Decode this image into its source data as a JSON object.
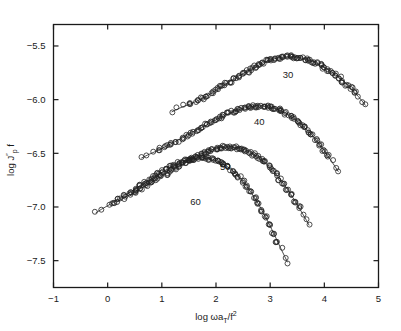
{
  "chart_data": {
    "type": "scatter",
    "title": "",
    "subtitle": "",
    "xlabel": "log ωa_T/f²",
    "xlabel_parts": {
      "main": "log ωa",
      "sub": "T",
      "mid": "/f",
      "sup": "2"
    },
    "ylabel": "log J″_p f",
    "ylabel_parts": {
      "main": "log J",
      "sup": "″",
      "sub": "p",
      "tail": "f"
    },
    "xlim": [
      -1,
      5
    ],
    "ylim": [
      -7.75,
      -5.3
    ],
    "xticks": [
      -1,
      0,
      1,
      2,
      3,
      4,
      5
    ],
    "xtick_labels": [
      "−1",
      "0",
      "1",
      "2",
      "3",
      "4",
      "5"
    ],
    "yticks": [
      -5.5,
      -6.0,
      -6.5,
      -7.0,
      -7.5
    ],
    "ytick_labels": [
      "−5.5",
      "−6.0",
      "−6.5",
      "−7.0",
      "−7.5"
    ],
    "grid": false,
    "legend_position": "inline-curve-labels",
    "marker": "open-circle",
    "marker_color": "#222222",
    "line_color": "#222222",
    "series": [
      {
        "name": "30",
        "label": "30",
        "label_x": 3.33,
        "label_y": -5.8,
        "points": [
          [
            1.18,
            -6.115
          ],
          [
            1.3,
            -6.085
          ],
          [
            1.42,
            -6.06
          ],
          [
            1.53,
            -6.04
          ],
          [
            1.64,
            -6.015
          ],
          [
            1.74,
            -5.99
          ],
          [
            1.84,
            -5.965
          ],
          [
            1.93,
            -5.935
          ],
          [
            2.02,
            -5.905
          ],
          [
            2.1,
            -5.88
          ],
          [
            2.18,
            -5.855
          ],
          [
            2.26,
            -5.83
          ],
          [
            2.34,
            -5.805
          ],
          [
            2.42,
            -5.78
          ],
          [
            2.5,
            -5.758
          ],
          [
            2.58,
            -5.735
          ],
          [
            2.66,
            -5.712
          ],
          [
            2.74,
            -5.692
          ],
          [
            2.81,
            -5.672
          ],
          [
            2.88,
            -5.655
          ],
          [
            2.95,
            -5.64
          ],
          [
            3.02,
            -5.628
          ],
          [
            3.09,
            -5.618
          ],
          [
            3.16,
            -5.61
          ],
          [
            3.23,
            -5.604
          ],
          [
            3.3,
            -5.6
          ],
          [
            3.37,
            -5.6
          ],
          [
            3.44,
            -5.602
          ],
          [
            3.51,
            -5.606
          ],
          [
            3.58,
            -5.612
          ],
          [
            3.65,
            -5.62
          ],
          [
            3.72,
            -5.632
          ],
          [
            3.79,
            -5.646
          ],
          [
            3.86,
            -5.662
          ],
          [
            3.93,
            -5.68
          ],
          [
            4.0,
            -5.7
          ],
          [
            4.07,
            -5.722
          ],
          [
            4.14,
            -5.745
          ],
          [
            4.21,
            -5.77
          ],
          [
            4.28,
            -5.798
          ],
          [
            4.35,
            -5.828
          ],
          [
            4.42,
            -5.86
          ],
          [
            4.49,
            -5.895
          ],
          [
            4.56,
            -5.932
          ],
          [
            4.63,
            -5.972
          ],
          [
            4.7,
            -6.014
          ],
          [
            4.76,
            -6.055
          ]
        ]
      },
      {
        "name": "40",
        "label": "40",
        "label_x": 2.8,
        "label_y": -6.24,
        "points": [
          [
            0.62,
            -6.545
          ],
          [
            0.74,
            -6.515
          ],
          [
            0.86,
            -6.488
          ],
          [
            0.97,
            -6.462
          ],
          [
            1.08,
            -6.435
          ],
          [
            1.18,
            -6.408
          ],
          [
            1.28,
            -6.382
          ],
          [
            1.38,
            -6.356
          ],
          [
            1.47,
            -6.33
          ],
          [
            1.56,
            -6.305
          ],
          [
            1.65,
            -6.282
          ],
          [
            1.74,
            -6.258
          ],
          [
            1.83,
            -6.235
          ],
          [
            1.91,
            -6.212
          ],
          [
            1.99,
            -6.19
          ],
          [
            2.07,
            -6.17
          ],
          [
            2.15,
            -6.15
          ],
          [
            2.23,
            -6.132
          ],
          [
            2.31,
            -6.115
          ],
          [
            2.38,
            -6.1
          ],
          [
            2.45,
            -6.088
          ],
          [
            2.52,
            -6.078
          ],
          [
            2.59,
            -6.07
          ],
          [
            2.66,
            -6.064
          ],
          [
            2.73,
            -6.06
          ],
          [
            2.8,
            -6.058
          ],
          [
            2.87,
            -6.06
          ],
          [
            2.94,
            -6.065
          ],
          [
            3.01,
            -6.072
          ],
          [
            3.08,
            -6.082
          ],
          [
            3.15,
            -6.095
          ],
          [
            3.22,
            -6.11
          ],
          [
            3.29,
            -6.128
          ],
          [
            3.36,
            -6.15
          ],
          [
            3.43,
            -6.174
          ],
          [
            3.5,
            -6.2
          ],
          [
            3.57,
            -6.23
          ],
          [
            3.64,
            -6.262
          ],
          [
            3.71,
            -6.298
          ],
          [
            3.78,
            -6.336
          ],
          [
            3.85,
            -6.378
          ],
          [
            3.92,
            -6.422
          ],
          [
            3.99,
            -6.47
          ],
          [
            4.06,
            -6.52
          ],
          [
            4.13,
            -6.572
          ],
          [
            4.2,
            -6.625
          ],
          [
            4.26,
            -6.672
          ]
        ]
      },
      {
        "name": "50",
        "label": "50",
        "label_x": 2.17,
        "label_y": -6.66,
        "points": [
          [
            0.18,
            -6.95
          ],
          [
            0.29,
            -6.918
          ],
          [
            0.4,
            -6.888
          ],
          [
            0.51,
            -6.858
          ],
          [
            0.61,
            -6.828
          ],
          [
            0.71,
            -6.8
          ],
          [
            0.81,
            -6.772
          ],
          [
            0.9,
            -6.744
          ],
          [
            0.99,
            -6.716
          ],
          [
            1.08,
            -6.69
          ],
          [
            1.17,
            -6.664
          ],
          [
            1.25,
            -6.64
          ],
          [
            1.33,
            -6.616
          ],
          [
            1.41,
            -6.592
          ],
          [
            1.49,
            -6.57
          ],
          [
            1.57,
            -6.548
          ],
          [
            1.64,
            -6.528
          ],
          [
            1.71,
            -6.51
          ],
          [
            1.78,
            -6.494
          ],
          [
            1.85,
            -6.48
          ],
          [
            1.92,
            -6.468
          ],
          [
            1.99,
            -6.458
          ],
          [
            2.06,
            -6.45
          ],
          [
            2.13,
            -6.444
          ],
          [
            2.2,
            -6.441
          ],
          [
            2.27,
            -6.441
          ],
          [
            2.34,
            -6.444
          ],
          [
            2.41,
            -6.45
          ],
          [
            2.48,
            -6.46
          ],
          [
            2.55,
            -6.472
          ],
          [
            2.62,
            -6.488
          ],
          [
            2.69,
            -6.508
          ],
          [
            2.76,
            -6.53
          ],
          [
            2.83,
            -6.556
          ],
          [
            2.9,
            -6.585
          ],
          [
            2.97,
            -6.618
          ],
          [
            3.04,
            -6.654
          ],
          [
            3.11,
            -6.694
          ],
          [
            3.18,
            -6.738
          ],
          [
            3.25,
            -6.786
          ],
          [
            3.32,
            -6.836
          ],
          [
            3.39,
            -6.89
          ],
          [
            3.46,
            -6.946
          ],
          [
            3.53,
            -7.004
          ],
          [
            3.6,
            -7.064
          ],
          [
            3.67,
            -7.124
          ],
          [
            3.72,
            -7.172
          ]
        ]
      },
      {
        "name": "60",
        "label": "60",
        "label_x": 1.62,
        "label_y": -6.98,
        "points": [
          [
            -0.22,
            -7.055
          ],
          [
            -0.11,
            -7.02
          ],
          [
            0.0,
            -6.988
          ],
          [
            0.11,
            -6.956
          ],
          [
            0.21,
            -6.924
          ],
          [
            0.31,
            -6.892
          ],
          [
            0.41,
            -6.862
          ],
          [
            0.51,
            -6.832
          ],
          [
            0.6,
            -6.802
          ],
          [
            0.69,
            -6.774
          ],
          [
            0.78,
            -6.746
          ],
          [
            0.86,
            -6.72
          ],
          [
            0.94,
            -6.694
          ],
          [
            1.02,
            -6.67
          ],
          [
            1.1,
            -6.648
          ],
          [
            1.17,
            -6.628
          ],
          [
            1.24,
            -6.61
          ],
          [
            1.31,
            -6.594
          ],
          [
            1.38,
            -6.58
          ],
          [
            1.45,
            -6.568
          ],
          [
            1.52,
            -6.558
          ],
          [
            1.59,
            -6.55
          ],
          [
            1.66,
            -6.545
          ],
          [
            1.73,
            -6.543
          ],
          [
            1.8,
            -6.544
          ],
          [
            1.87,
            -6.548
          ],
          [
            1.94,
            -6.556
          ],
          [
            2.01,
            -6.568
          ],
          [
            2.08,
            -6.584
          ],
          [
            2.15,
            -6.604
          ],
          [
            2.22,
            -6.628
          ],
          [
            2.29,
            -6.656
          ],
          [
            2.36,
            -6.688
          ],
          [
            2.43,
            -6.724
          ],
          [
            2.5,
            -6.764
          ],
          [
            2.57,
            -6.808
          ],
          [
            2.64,
            -6.858
          ],
          [
            2.71,
            -6.912
          ],
          [
            2.78,
            -6.97
          ],
          [
            2.85,
            -7.032
          ],
          [
            2.92,
            -7.098
          ],
          [
            2.99,
            -7.168
          ],
          [
            3.06,
            -7.24
          ],
          [
            3.13,
            -7.314
          ],
          [
            3.2,
            -7.39
          ],
          [
            3.27,
            -7.462
          ],
          [
            3.32,
            -7.515
          ]
        ]
      }
    ]
  }
}
